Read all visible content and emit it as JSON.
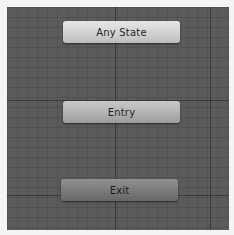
{
  "window": {
    "type": "animator-state-machine-graph"
  },
  "canvas": {
    "background_color": "#5b5b5b",
    "grid": {
      "minor_spacing_px": 10,
      "major_lines_vertical_x": [
        108,
        203
      ],
      "major_lines_horizontal_y": [
        93,
        188
      ]
    }
  },
  "nodes": [
    {
      "id": "any-state",
      "label": "Any State",
      "color": "#d2d2d2"
    },
    {
      "id": "entry",
      "label": "Entry",
      "color": "#b2b2b2"
    },
    {
      "id": "exit",
      "label": "Exit",
      "color": "#7a7a7a"
    }
  ]
}
